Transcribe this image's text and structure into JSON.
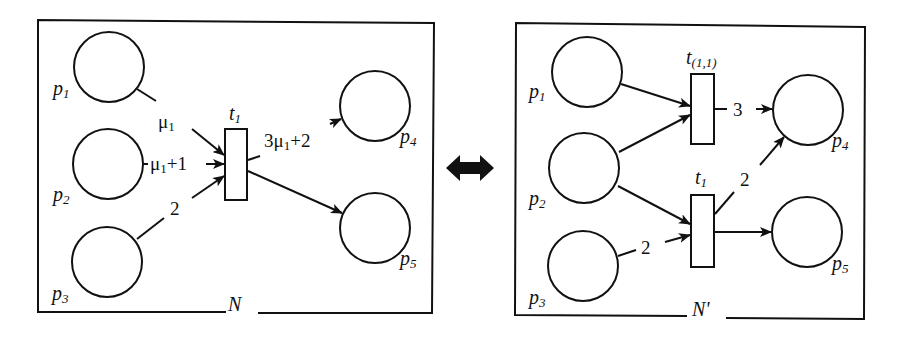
{
  "diagram": {
    "type": "petri-net-transformation",
    "colors": {
      "stroke": "#111111",
      "background": "#ffffff"
    },
    "equivalence_arrow": {
      "icon": "double-headed-arrow-icon"
    },
    "nets": [
      {
        "name": "N",
        "places": [
          {
            "id": "p1",
            "base": "p",
            "sub": "1"
          },
          {
            "id": "p2",
            "base": "p",
            "sub": "2"
          },
          {
            "id": "p3",
            "base": "p",
            "sub": "3"
          },
          {
            "id": "p4",
            "base": "p",
            "sub": "4"
          },
          {
            "id": "p5",
            "base": "p",
            "sub": "5"
          }
        ],
        "transitions": [
          {
            "id": "t1",
            "base": "t",
            "sub": "1"
          }
        ],
        "arcs": [
          {
            "from": "p1",
            "to": "t1",
            "weight": "μ1",
            "w_base": "μ",
            "w_sub": "1",
            "w_tail": ""
          },
          {
            "from": "p2",
            "to": "t1",
            "weight": "μ1+1",
            "w_base": "μ",
            "w_sub": "1",
            "w_tail": "+1"
          },
          {
            "from": "p3",
            "to": "t1",
            "weight": "2"
          },
          {
            "from": "t1",
            "to": "p4",
            "weight": "3μ1+2",
            "w_head": "3μ",
            "w_sub": "1",
            "w_tail": "+2"
          },
          {
            "from": "t1",
            "to": "p5",
            "weight": ""
          }
        ]
      },
      {
        "name": "N'",
        "places": [
          {
            "id": "p1",
            "base": "p",
            "sub": "1"
          },
          {
            "id": "p2",
            "base": "p",
            "sub": "2"
          },
          {
            "id": "p3",
            "base": "p",
            "sub": "3"
          },
          {
            "id": "p4",
            "base": "p",
            "sub": "4"
          },
          {
            "id": "p5",
            "base": "p",
            "sub": "5"
          }
        ],
        "transitions": [
          {
            "id": "t(1,1)",
            "base": "t",
            "sub": "(1,1)"
          },
          {
            "id": "t1",
            "base": "t",
            "sub": "1"
          }
        ],
        "arcs": [
          {
            "from": "p1",
            "to": "t(1,1)",
            "weight": ""
          },
          {
            "from": "p2",
            "to": "t(1,1)",
            "weight": ""
          },
          {
            "from": "p2",
            "to": "t1",
            "weight": ""
          },
          {
            "from": "p3",
            "to": "t1",
            "weight": "2"
          },
          {
            "from": "t(1,1)",
            "to": "p4",
            "weight": "3"
          },
          {
            "from": "t1",
            "to": "p4",
            "weight": "2"
          },
          {
            "from": "t1",
            "to": "p5",
            "weight": ""
          }
        ]
      }
    ]
  }
}
